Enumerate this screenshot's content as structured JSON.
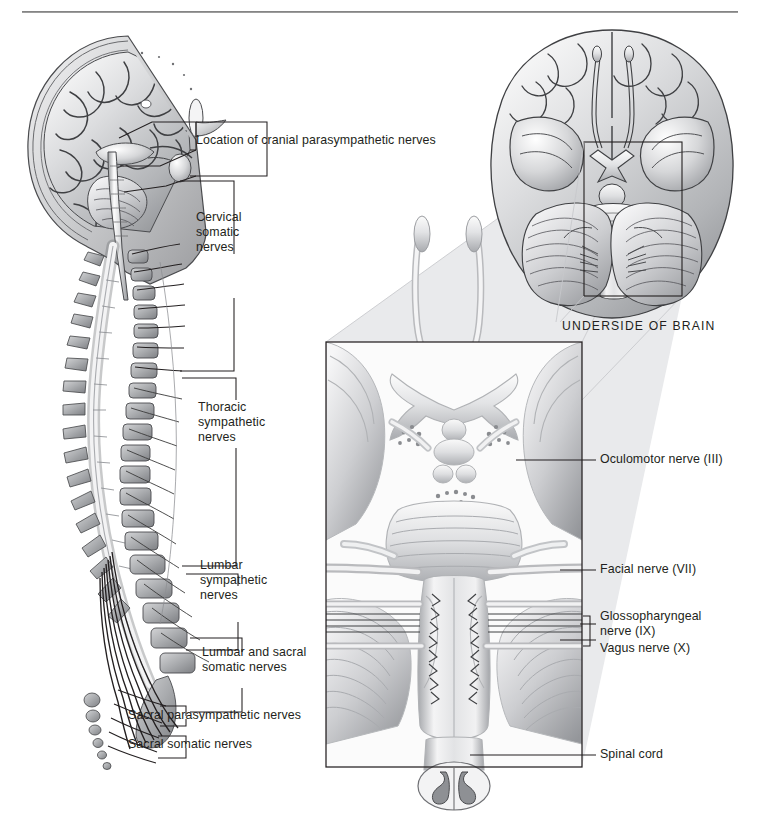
{
  "figure": {
    "kind": "anatomical-illustration",
    "background_color": "#ffffff",
    "ink_color": "#231f20",
    "panel_tint": "#e9eaec"
  },
  "labels": {
    "cranial_parasympathetic": "Location of cranial parasympathetic nerves",
    "cervical_somatic": [
      "Cervical",
      "somatic",
      "nerves"
    ],
    "thoracic_sympathetic": [
      "Thoracic",
      "sympathetic",
      "nerves"
    ],
    "lumbar_sympathetic": [
      "Lumbar",
      "sympathetic",
      "nerves"
    ],
    "lumbar_sacral_somatic": [
      "Lumbar and sacral",
      "somatic nerves"
    ],
    "sacral_parasympathetic": "Sacral parasympathetic nerves",
    "sacral_somatic": "Sacral somatic nerves",
    "underside_of_brain": "UNDERSIDE OF BRAIN",
    "oculomotor": "Oculomotor nerve (III)",
    "facial": "Facial nerve (VII)",
    "glossopharyngeal": [
      "Glossopharyngeal",
      "nerve (IX)"
    ],
    "vagus": "Vagus nerve (X)",
    "spinal_cord": "Spinal cord"
  },
  "panels": {
    "sagittal_head": "Midsagittal section of head showing brain, brainstem and cervical spine",
    "spinal_column": "Lateral view of vertebral column with spinal nerves and sympathetic chain",
    "inferior_brain": "Inferior (ventral) view of the brain with cranial nerves",
    "brainstem_detail": "Magnified ventral brainstem showing cranial nerve roots and spinal cord"
  }
}
